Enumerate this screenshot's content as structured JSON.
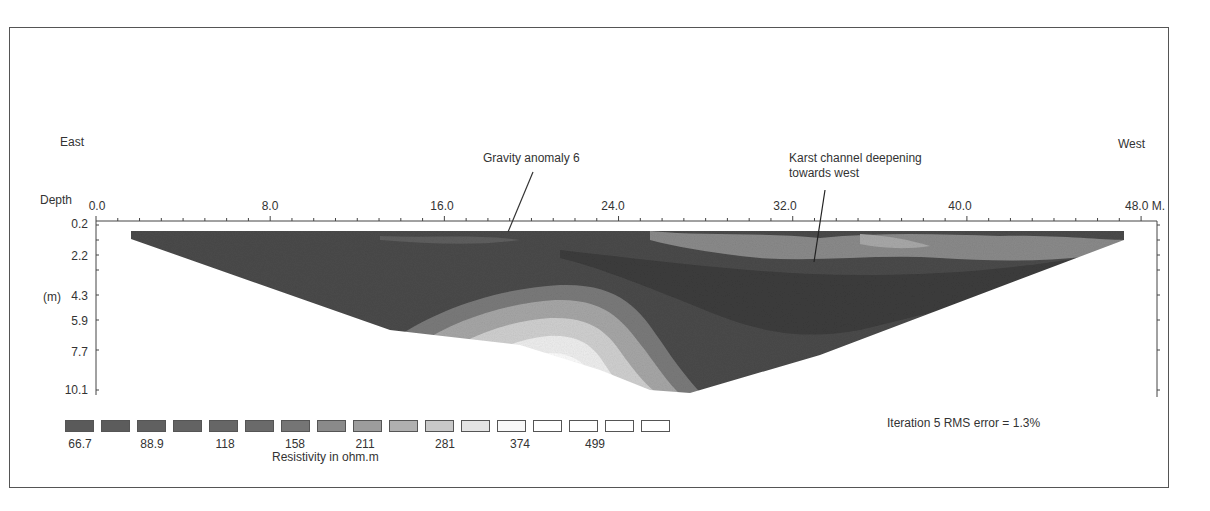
{
  "chart_data": {
    "type": "heatmap",
    "orientation": {
      "left": "East",
      "right": "West"
    },
    "xlabel": "Distance (M.)",
    "x_ticks": [
      "0.0",
      "8.0",
      "16.0",
      "24.0",
      "32.0",
      "40.0",
      "48.0 M."
    ],
    "x_range": [
      0,
      48
    ],
    "ylabel": "Depth (m)",
    "y_ticks": [
      "0.2",
      "2.2",
      "4.3",
      "5.9",
      "7.7",
      "10.1"
    ],
    "y_range": [
      0.2,
      10.1
    ],
    "colorbar": {
      "label": "Resistivity in ohm.m",
      "tick_labels": [
        "66.7",
        "88.9",
        "118",
        "158",
        "211",
        "281",
        "374",
        "499"
      ],
      "swatch_count": 17
    },
    "annotations": [
      {
        "text": "Gravity anomaly 6",
        "x": 17.5,
        "depth": 0.2
      },
      {
        "text": "Karst channel deepening towards west",
        "x": 33.5,
        "depth": 2.2
      }
    ],
    "stats": {
      "iteration": 5,
      "rms_error_pct": 1.3,
      "text": "Iteration 5 RMS error = 1.3%"
    }
  },
  "labels": {
    "east": "East",
    "west": "West",
    "depth": "Depth",
    "depth_unit": "(m)",
    "anomaly": "Gravity anomaly 6",
    "karst_line1": "Karst channel deepening",
    "karst_line2": "towards west",
    "rms": "Iteration 5 RMS error = 1.3%",
    "legend_title": "Resistivity in  ohm.m"
  },
  "x_axis": {
    "t0": "0.0",
    "t1": "8.0",
    "t2": "16.0",
    "t3": "24.0",
    "t4": "32.0",
    "t5": "40.0",
    "t6": "48.0 M."
  },
  "y_axis": {
    "d0": "0.2",
    "d1": "2.2",
    "d2": "4.3",
    "d3": "5.9",
    "d4": "7.7",
    "d5": "10.1"
  },
  "legend": {
    "v0": "66.7",
    "v1": "88.9",
    "v2": "118",
    "v3": "158",
    "v4": "211",
    "v5": "281",
    "v6": "374",
    "v7": "499",
    "colors": [
      "#5a5a5a",
      "#5c5c5c",
      "#606060",
      "#636363",
      "#666666",
      "#6a6a6a",
      "#757575",
      "#8a8a8a",
      "#9c9c9c",
      "#b0b0b0",
      "#c8c8c8",
      "#e4e4e4",
      "#f8f8f8",
      "#ffffff",
      "#ffffff",
      "#ffffff",
      "#ffffff"
    ]
  }
}
